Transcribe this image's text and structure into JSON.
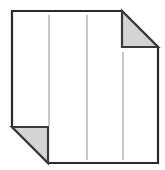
{
  "figure": {
    "kind": "document-page-icon",
    "canvas": {
      "width": 165,
      "height": 170,
      "background": "#ffffff"
    },
    "colors": {
      "page_fill": "#ffffff",
      "outline": "#2a2a2a",
      "fold_fill": "#d4d4d4",
      "fold_edge": "#3a3a3a",
      "rule_line": "#9a9a9a"
    },
    "stroke_widths": {
      "outline": 2.2,
      "fold_edge": 2.2,
      "rule_line": 1.1
    },
    "page_outline_points": "12,11 122,11 158,47 158,163 48,163 12,127",
    "folds": [
      {
        "name": "top-right-fold",
        "points": "122,11 158,47 122,47",
        "corner": "top-right"
      },
      {
        "name": "bottom-left-fold",
        "points": "12,127 48,163 48,127",
        "corner": "bottom-left"
      }
    ],
    "rule_lines": [
      {
        "name": "rule-line-1",
        "x": 49,
        "y1": 15,
        "y2": 126
      },
      {
        "name": "rule-line-2",
        "x": 87,
        "y1": 15,
        "y2": 160
      },
      {
        "name": "rule-line-3",
        "x": 123,
        "y1": 52,
        "y2": 160
      }
    ]
  }
}
